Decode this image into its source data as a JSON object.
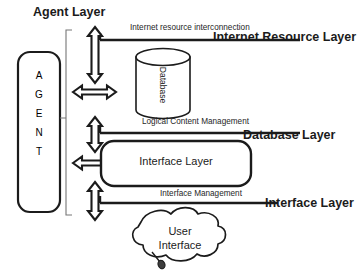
{
  "diagram": {
    "background_color": "#ffffff",
    "stroke_color": "#1b1b1b",
    "text_color": "#1b1b1b"
  },
  "labels": {
    "agent_layer": "Agent Layer",
    "internet_resource_layer": "Internet Resource Layer",
    "database_layer": "Database Layer",
    "interface_layer_right": "Interface Layer"
  },
  "flows": {
    "internet_resource_interconnection": "Internet resource interconnection",
    "logical_content_management": "Logical Content Management",
    "interface_management": "Interface Management"
  },
  "nodes": {
    "agent": {
      "label": "AGENT",
      "letters": [
        "A",
        "G",
        "E",
        "N",
        "T"
      ]
    },
    "database": {
      "label": "Database"
    },
    "interface_layer_box": {
      "label": "Interface Layer"
    },
    "user_interface_cloud": {
      "line1": "User",
      "line2": "Interface"
    }
  },
  "connectors": [
    {
      "name": "agent-to-internet-resource",
      "type": "double-arrow-vertical"
    },
    {
      "name": "agent-horizontal-top",
      "type": "double-arrow-horizontal"
    },
    {
      "name": "agent-to-database",
      "type": "double-arrow-vertical"
    },
    {
      "name": "agent-to-interface-box",
      "type": "double-arrow-horizontal"
    },
    {
      "name": "agent-to-user-interface",
      "type": "double-arrow-vertical"
    }
  ]
}
